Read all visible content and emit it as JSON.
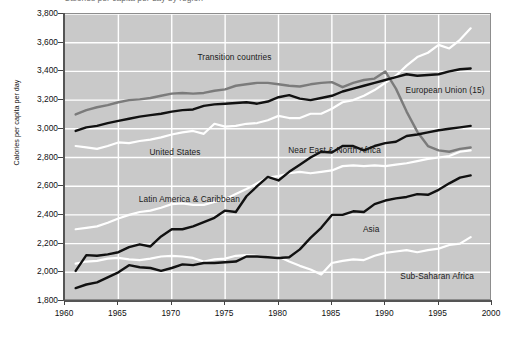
{
  "figure": {
    "clipped_title": "Calories per capita per day by region"
  },
  "axes": {
    "ylabel": "Calories per capita per day",
    "yticks": [
      "3,800",
      "3,600",
      "3,400",
      "3,200",
      "3,000",
      "2,800",
      "2,600",
      "2,400",
      "2,200",
      "2,000",
      "1,800"
    ],
    "xticks": [
      "1960",
      "1965",
      "1970",
      "1975",
      "1980",
      "1985",
      "1990",
      "1995",
      "2000"
    ]
  },
  "series_labels": {
    "transition": "Transition countries",
    "eu": "European Union (15)",
    "us": "United States",
    "nena": "Near East & North Africa",
    "lac": "Latin America & Caribbean",
    "asia": "Asia",
    "ssa": "Sub-Saharan Africa"
  },
  "chart_data": {
    "type": "line",
    "title": "Calories per capita per day by region",
    "xlabel": "",
    "ylabel": "Calories per capita per day",
    "xlim": [
      1960,
      2000
    ],
    "ylim": [
      1800,
      3800
    ],
    "ytick_step": 200,
    "xtick_step": 5,
    "grid": true,
    "grid_color": "#ffffff",
    "plot_background": "#c9c9c9",
    "legend": "inline-annotations",
    "x": [
      1961,
      1962,
      1963,
      1964,
      1965,
      1966,
      1967,
      1968,
      1969,
      1970,
      1971,
      1972,
      1973,
      1974,
      1975,
      1976,
      1977,
      1978,
      1979,
      1980,
      1981,
      1982,
      1983,
      1984,
      1985,
      1986,
      1987,
      1988,
      1989,
      1990,
      1991,
      1992,
      1993,
      1994,
      1995,
      1996,
      1997,
      1998
    ],
    "series": [
      {
        "name": "Transition countries",
        "color": "#7b7b7b",
        "style": "solid",
        "values": [
          3100,
          3130,
          3150,
          3165,
          3185,
          3200,
          3205,
          3215,
          3230,
          3245,
          3250,
          3245,
          3250,
          3265,
          3275,
          3300,
          3310,
          3320,
          3320,
          3310,
          3300,
          3295,
          3310,
          3320,
          3325,
          3290,
          3320,
          3340,
          3350,
          3400,
          3280,
          3120,
          2980,
          2880,
          2850,
          2840,
          2860,
          2870
        ]
      },
      {
        "name": "European Union (15)",
        "color": "#111111",
        "style": "solid",
        "values": [
          2985,
          3010,
          3020,
          3040,
          3055,
          3070,
          3085,
          3095,
          3105,
          3120,
          3130,
          3135,
          3160,
          3170,
          3175,
          3180,
          3185,
          3175,
          3190,
          3220,
          3235,
          3210,
          3200,
          3215,
          3230,
          3260,
          3280,
          3300,
          3320,
          3340,
          3360,
          3380,
          3370,
          3375,
          3380,
          3400,
          3415,
          3420
        ]
      },
      {
        "name": "United States",
        "color": "#ffffff",
        "style": "solid",
        "values": [
          2880,
          2870,
          2860,
          2880,
          2905,
          2900,
          2915,
          2925,
          2940,
          2960,
          2975,
          2985,
          2965,
          3035,
          3015,
          3020,
          3035,
          3040,
          3060,
          3090,
          3075,
          3075,
          3105,
          3105,
          3140,
          3185,
          3200,
          3230,
          3270,
          3320,
          3370,
          3440,
          3500,
          3530,
          3585,
          3560,
          3620,
          3700
        ]
      },
      {
        "name": "Near East & North Africa",
        "color": "#111111",
        "style": "solid",
        "values": [
          2010,
          2120,
          2115,
          2125,
          2140,
          2175,
          2195,
          2180,
          2250,
          2300,
          2300,
          2320,
          2350,
          2380,
          2430,
          2420,
          2530,
          2600,
          2665,
          2640,
          2700,
          2750,
          2800,
          2840,
          2835,
          2880,
          2880,
          2850,
          2880,
          2900,
          2910,
          2950,
          2960,
          2975,
          2990,
          3000,
          3010,
          3020
        ]
      },
      {
        "name": "Latin America & Caribbean",
        "color": "#ffffff",
        "style": "solid",
        "values": [
          2300,
          2310,
          2320,
          2345,
          2375,
          2400,
          2420,
          2430,
          2450,
          2475,
          2480,
          2470,
          2470,
          2490,
          2510,
          2545,
          2580,
          2620,
          2660,
          2670,
          2690,
          2700,
          2690,
          2700,
          2710,
          2740,
          2745,
          2740,
          2745,
          2740,
          2750,
          2760,
          2775,
          2790,
          2800,
          2810,
          2840,
          2850
        ]
      },
      {
        "name": "Asia",
        "color": "#111111",
        "style": "solid",
        "values": [
          1890,
          1915,
          1930,
          1965,
          2000,
          2050,
          2035,
          2030,
          2010,
          2030,
          2055,
          2050,
          2065,
          2065,
          2070,
          2075,
          2110,
          2110,
          2105,
          2100,
          2105,
          2160,
          2240,
          2310,
          2400,
          2400,
          2425,
          2420,
          2475,
          2500,
          2515,
          2525,
          2545,
          2540,
          2575,
          2620,
          2660,
          2675
        ]
      },
      {
        "name": "Sub-Saharan Africa",
        "color": "#ffffff",
        "style": "solid",
        "values": [
          2060,
          2075,
          2080,
          2095,
          2100,
          2090,
          2085,
          2095,
          2110,
          2115,
          2110,
          2100,
          2075,
          2090,
          2095,
          2115,
          2120,
          2115,
          2105,
          2110,
          2075,
          2045,
          2020,
          1985,
          2065,
          2080,
          2090,
          2085,
          2115,
          2135,
          2145,
          2155,
          2140,
          2155,
          2165,
          2190,
          2200,
          2245
        ]
      }
    ],
    "annotations": [
      {
        "text": "Transition countries",
        "x": 1972.5,
        "y": 3490
      },
      {
        "text": "European Union (15)",
        "x": 1992.0,
        "y": 3260
      },
      {
        "text": "United States",
        "x": 1968.0,
        "y": 2830
      },
      {
        "text": "Near East & North Africa",
        "x": 1981.0,
        "y": 2845
      },
      {
        "text": "Latin America & Caribbean",
        "x": 1967.0,
        "y": 2505
      },
      {
        "text": "Asia",
        "x": 1988.0,
        "y": 2295
      },
      {
        "text": "Sub-Saharan Africa",
        "x": 1991.5,
        "y": 1965
      }
    ]
  }
}
